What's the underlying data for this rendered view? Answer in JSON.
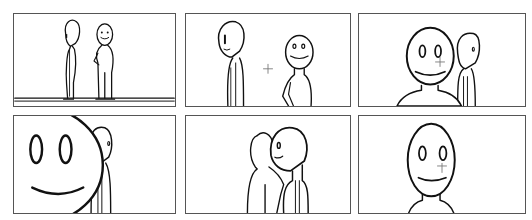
{
  "storyboard": {
    "layout": {
      "rows": 2,
      "cols": 3
    },
    "panels": [
      {
        "id": 1,
        "shot": "wide",
        "description": "Two stick figures standing on floor line; left faces right in profile, right faces viewer smiling with hand on hip"
      },
      {
        "id": 2,
        "shot": "medium",
        "description": "Profile figure left, smiling front-facing figure right, crosshair between"
      },
      {
        "id": 3,
        "shot": "close-up",
        "description": "Large smiling face with crosshair; profile figure behind right"
      },
      {
        "id": 4,
        "shot": "extreme close-up",
        "description": "Huge smiling face cropped at left edge, profile figure behind"
      },
      {
        "id": 5,
        "shot": "over-the-shoulder",
        "description": "Profile figure faces smiling figure seen from behind"
      },
      {
        "id": 6,
        "shot": "close-up",
        "description": "Single smiling face centered with crosshair"
      }
    ],
    "colors": {
      "border": "#555555",
      "ink": "#111111",
      "background": "#ffffff"
    }
  }
}
